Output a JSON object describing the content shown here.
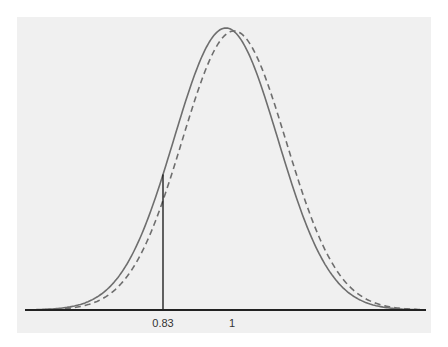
{
  "chart_data": {
    "type": "line",
    "title": "",
    "xlabel": "",
    "ylabel": "",
    "xlim": [
      0.47,
      1.46
    ],
    "grid": false,
    "legend": "none",
    "tick_labels": [
      "0.83",
      "1"
    ],
    "tick_values": [
      0.83,
      1.0
    ],
    "marker_line": {
      "x": 0.83
    },
    "series": [
      {
        "name": "solid-distribution",
        "style": "solid",
        "color": "#6e6e6e",
        "distribution": "normal",
        "mean": 0.985,
        "sd": 0.128
      },
      {
        "name": "dashed-distribution",
        "style": "dashed",
        "color": "#6e6e6e",
        "distribution": "normal",
        "mean": 1.005,
        "sd": 0.128
      }
    ]
  }
}
